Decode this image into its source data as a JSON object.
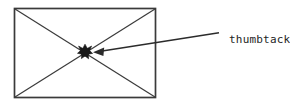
{
  "figure": {
    "title": "thumbtack-on-rectangle-diagram",
    "background_color": "#ffffff",
    "ink_color": "#242424"
  },
  "shapes": {
    "rectangle": {
      "name": "rectangle",
      "stroke_color": "#3a3a3a",
      "stroke_width": 1.6,
      "x": 14,
      "y": 8,
      "width": 142,
      "height": 90
    },
    "diagonals": {
      "name": "diagonals",
      "stroke_color": "#3a3a3a",
      "stroke_width": 1.2,
      "description": "two diagonals forming an X across the rectangle"
    },
    "thumbtack": {
      "name": "thumbtack",
      "fill_color": "#1a1a1a",
      "center_x": 85,
      "center_y": 52,
      "radius": 7,
      "description": "black star-like blob marking the intersection of the diagonals"
    }
  },
  "annotation": {
    "label": "thumbtack",
    "label_x": 229,
    "label_y": 33,
    "arrow": {
      "name": "annotation-arrow",
      "stroke_color": "#2b2b2b",
      "stroke_width": 1.4,
      "tail_x": 219,
      "tail_y": 33,
      "tip_x": 93,
      "tip_y": 52
    }
  }
}
